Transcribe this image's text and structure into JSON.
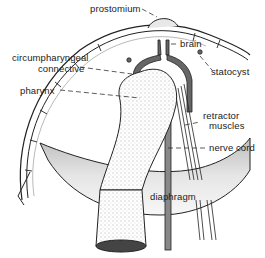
{
  "diagram": {
    "labels": {
      "prostomium": "prostomium",
      "brain": "brain",
      "circumpharyngeal_line1": "circumpharyngeal",
      "circumpharyngeal_line2": "connective",
      "statocyst": "statocyst",
      "pharynx": "pharynx",
      "retractor_line1": "retractor",
      "retractor_line2": "muscles",
      "nerve_cord": "nerve cord",
      "diaphragm": "diaphragm"
    },
    "colors": {
      "ink": "#222222",
      "shade": "#cfcfcf",
      "background": "#ffffff"
    }
  }
}
